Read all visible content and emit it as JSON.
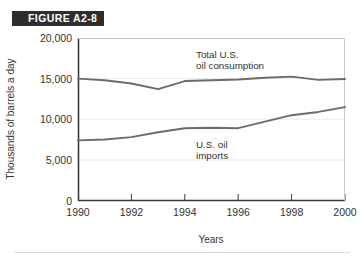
{
  "figure": {
    "badge_label": "FIGURE A2-8",
    "badge_color": "#2e2e2e"
  },
  "chart_data": {
    "type": "line",
    "title": "",
    "xlabel": "Years",
    "ylabel": "Thousands of barrels a day",
    "xlim": [
      1990,
      2000
    ],
    "ylim": [
      0,
      20000
    ],
    "grid": true,
    "legend_position": "inline-annotation",
    "x": [
      1990,
      1991,
      1992,
      1993,
      1994,
      1995,
      1996,
      1997,
      1998,
      1999,
      2000
    ],
    "xtick_labels": [
      "1990",
      "1992",
      "1994",
      "1996",
      "1998",
      "2000"
    ],
    "xticks": [
      1990,
      1992,
      1994,
      1996,
      1998,
      2000
    ],
    "ytick_labels": [
      "0",
      "5,000",
      "10,000",
      "15,000",
      "20,000"
    ],
    "yticks": [
      0,
      5000,
      10000,
      15000,
      20000
    ],
    "series": [
      {
        "name": "Total U.S. oil consumption",
        "color": "#6b6b6b",
        "annotation_lines": [
          "Total U.S.",
          "oil consumption"
        ],
        "values": [
          15000,
          14800,
          14400,
          13700,
          14700,
          14800,
          14900,
          15100,
          15250,
          14850,
          14950
        ]
      },
      {
        "name": "U.S. oil imports",
        "color": "#6b6b6b",
        "annotation_lines": [
          "U.S. oil",
          "imports"
        ],
        "values": [
          7400,
          7500,
          7800,
          8400,
          8900,
          8950,
          8900,
          9700,
          10500,
          10900,
          11500
        ]
      }
    ]
  }
}
